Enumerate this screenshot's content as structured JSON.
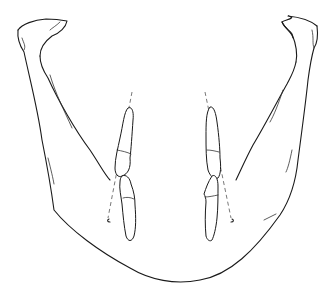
{
  "figure": {
    "view": "frontal-superior",
    "colors": {
      "stroke": "#1a1a1a",
      "axis_line": "#555555",
      "background": "#ffffff"
    },
    "elements": {
      "mandible_outline": "mandible",
      "left_condyle": "left condyle",
      "right_condyle": "right condyle",
      "left_upper_tooth": "left upper tooth",
      "left_lower_tooth": "left lower tooth",
      "right_upper_tooth": "right upper tooth",
      "right_lower_tooth": "right lower tooth",
      "left_axis": "left tooth long axis",
      "right_axis": "right tooth long axis"
    },
    "labels": []
  }
}
